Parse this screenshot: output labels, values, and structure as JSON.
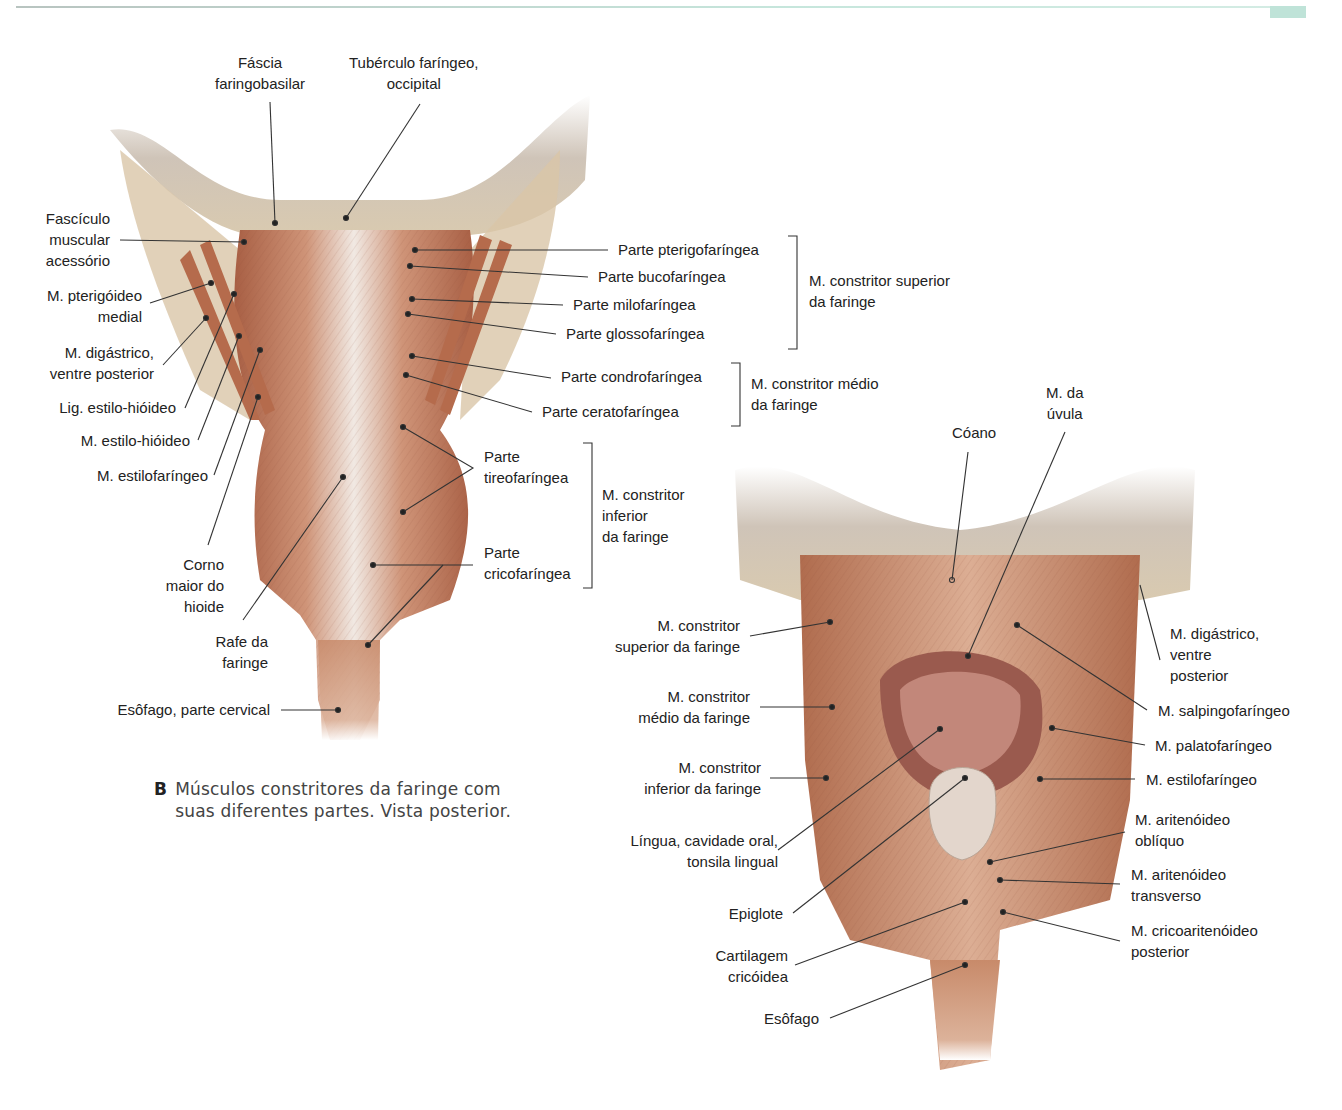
{
  "colors": {
    "muscle": "#c98e6e",
    "muscle_dark": "#a0583e",
    "fascia": "#efe9e4",
    "bone": "#d8cab4",
    "leader": "#333333",
    "header_accent": "#bfe3d8"
  },
  "figure_b": {
    "caption_letter": "B",
    "caption_line1": "Músculos constritores da faringe com",
    "caption_line2": "suas diferentes partes. Vista posterior.",
    "labels": {
      "fascia": "Fáscia\nfaringobasilar",
      "tuberculo": "Tubérculo faríngeo,\noccipital",
      "fasciculo": "Fascículo\nmuscular\nacessório",
      "pterigoideo": "M. pterigóideo\nmedial",
      "digastrico": "M. digástrico,\nventre posterior",
      "lig_estilo": "Lig. estilo-hióideo",
      "estilo_hioideo": "M. estilo-hióideo",
      "estilofaringeo": "M. estilofaríngeo",
      "corno": "Corno\nmaior do\nhioide",
      "rafe": "Rafe da\nfaringe",
      "esofago_cervical": "Esôfago, parte cervical",
      "pterigofaringea": "Parte pterigofaríngea",
      "bucofaringea": "Parte bucofaríngea",
      "milofaringea": "Parte milofaríngea",
      "glossofaringea": "Parte glossofaríngea",
      "condrofaringea": "Parte condrofaríngea",
      "ceratofaringea": "Parte ceratofaríngea",
      "tireofaringea": "Parte\ntireofaríngea",
      "cricofaringea": "Parte\ncricofaríngea",
      "group_superior": "M. constritor superior\nda faringe",
      "group_medio": "M. constritor médio\nda faringe",
      "group_inferior": "M. constritor\ninferior\nda faringe"
    }
  },
  "figure_c": {
    "labels": {
      "coano": "Cóano",
      "uvula": "M. da\núvula",
      "constritor_sup": "M. constritor\nsuperior da faringe",
      "constritor_med": "M. constritor\nmédio da faringe",
      "constritor_inf": "M. constritor\ninferior da faringe",
      "lingua": "Língua, cavidade oral,\ntonsila lingual",
      "epiglote": "Epiglote",
      "cartilagem": "Cartilagem\ncricóidea",
      "esofago": "Esôfago",
      "digastrico": "M. digástrico,\nventre\nposterior",
      "salpingo": "M. salpingofaríngeo",
      "palato": "M. palatofaríngeo",
      "estilo": "M. estilofaríngeo",
      "arit_obliquo": "M. aritenóideo\noblíquo",
      "arit_transverso": "M. aritenóideo\ntransverso",
      "cricoarit": "M. cricoaritenóideo\nposterior"
    }
  }
}
